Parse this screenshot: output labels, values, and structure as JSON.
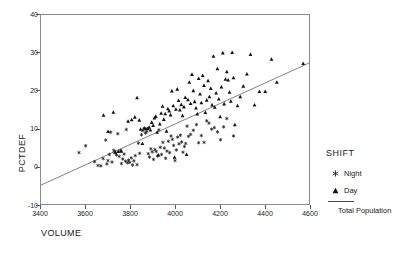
{
  "chart_data": {
    "type": "scatter",
    "title": "",
    "xlabel": "VOLUME",
    "ylabel": "PCTDEF",
    "xlim": [
      3400,
      4600
    ],
    "ylim": [
      -10,
      40
    ],
    "xticks": [
      3400,
      3600,
      3800,
      4000,
      4200,
      4400,
      4600
    ],
    "yticks": [
      -10,
      0,
      10,
      20,
      30,
      40
    ],
    "grid": false,
    "legend_position": "right",
    "legend": {
      "title": "SHIFT",
      "entries": [
        {
          "label": "Night",
          "marker": "asterisk-icon"
        },
        {
          "label": "Day",
          "marker": "triangle-icon"
        },
        {
          "label": "Total Population",
          "marker": "line-icon"
        }
      ]
    },
    "series": [
      {
        "name": "Night",
        "marker": "asterisk",
        "points": [
          [
            3570,
            3.6
          ],
          [
            3600,
            5.4
          ],
          [
            3640,
            1.2
          ],
          [
            3655,
            0.2
          ],
          [
            3668,
            0.1
          ],
          [
            3678,
            2.0
          ],
          [
            3690,
            6.9
          ],
          [
            3695,
            0.6
          ],
          [
            3700,
            1.5
          ],
          [
            3706,
            3.1
          ],
          [
            3712,
            9.0
          ],
          [
            3718,
            1.1
          ],
          [
            3726,
            4.2
          ],
          [
            3732,
            3.5
          ],
          [
            3738,
            3.0
          ],
          [
            3744,
            8.6
          ],
          [
            3750,
            2.6
          ],
          [
            3756,
            4.1
          ],
          [
            3760,
            0.7
          ],
          [
            3766,
            1.9
          ],
          [
            3772,
            3.2
          ],
          [
            3778,
            1.3
          ],
          [
            3782,
            9.7
          ],
          [
            3788,
            0.9
          ],
          [
            3792,
            1.6
          ],
          [
            3798,
            1.0
          ],
          [
            3804,
            2.2
          ],
          [
            3810,
            0.3
          ],
          [
            3816,
            1.4
          ],
          [
            3822,
            2.8
          ],
          [
            3830,
            0.4
          ],
          [
            3836,
            6.1
          ],
          [
            3842,
            3.4
          ],
          [
            3850,
            8.3
          ],
          [
            3856,
            9.4
          ],
          [
            3862,
            9.9
          ],
          [
            3868,
            8.8
          ],
          [
            3874,
            9.2
          ],
          [
            3880,
            3.3
          ],
          [
            3886,
            2.4
          ],
          [
            3892,
            4.6
          ],
          [
            3898,
            3.8
          ],
          [
            3904,
            1.8
          ],
          [
            3910,
            4.4
          ],
          [
            3916,
            3.9
          ],
          [
            3922,
            2.7
          ],
          [
            3928,
            9.6
          ],
          [
            3934,
            5.0
          ],
          [
            3940,
            3.1
          ],
          [
            3946,
            6.3
          ],
          [
            3952,
            4.8
          ],
          [
            3958,
            2.1
          ],
          [
            3964,
            4.0
          ],
          [
            3970,
            6.6
          ],
          [
            3976,
            3.6
          ],
          [
            3982,
            8.0
          ],
          [
            3988,
            7.1
          ],
          [
            3994,
            5.5
          ],
          [
            4000,
            1.5
          ],
          [
            4006,
            4.3
          ],
          [
            4012,
            7.7
          ],
          [
            4018,
            5.9
          ],
          [
            4024,
            8.2
          ],
          [
            4030,
            6.4
          ],
          [
            4036,
            3.7
          ],
          [
            4042,
            5.2
          ],
          [
            4048,
            6.0
          ],
          [
            4054,
            10.6
          ],
          [
            4060,
            7.9
          ],
          [
            4070,
            8.4
          ],
          [
            4082,
            9.5
          ],
          [
            4096,
            11.0
          ],
          [
            4106,
            6.2
          ],
          [
            4118,
            8.1
          ],
          [
            4130,
            6.3
          ],
          [
            4142,
            12.0
          ],
          [
            4152,
            11.4
          ],
          [
            4164,
            9.8
          ],
          [
            4176,
            10.2
          ],
          [
            4190,
            9.1
          ],
          [
            4204,
            7.0
          ],
          [
            4218,
            10.4
          ],
          [
            4232,
            12.6
          ],
          [
            4262,
            8.0
          ]
        ]
      },
      {
        "name": "Day",
        "marker": "triangle",
        "points": [
          [
            3680,
            13.5
          ],
          [
            3700,
            9.2
          ],
          [
            3724,
            14.3
          ],
          [
            3732,
            3.8
          ],
          [
            3746,
            3.9
          ],
          [
            3760,
            4.0
          ],
          [
            3790,
            11.9
          ],
          [
            3806,
            12.3
          ],
          [
            3820,
            13.0
          ],
          [
            3830,
            18.1
          ],
          [
            3840,
            12.2
          ],
          [
            3846,
            9.8
          ],
          [
            3854,
            6.0
          ],
          [
            3862,
            10.1
          ],
          [
            3870,
            9.9
          ],
          [
            3878,
            10.0
          ],
          [
            3884,
            10.3
          ],
          [
            3890,
            9.6
          ],
          [
            3896,
            11.6
          ],
          [
            3902,
            10.8
          ],
          [
            3908,
            12.8
          ],
          [
            3914,
            13.2
          ],
          [
            3920,
            9.0
          ],
          [
            3926,
            3.0
          ],
          [
            3932,
            11.2
          ],
          [
            3938,
            14.0
          ],
          [
            3944,
            15.9
          ],
          [
            3950,
            12.4
          ],
          [
            3956,
            13.9
          ],
          [
            3962,
            9.3
          ],
          [
            3968,
            15.2
          ],
          [
            3974,
            14.6
          ],
          [
            3980,
            13.6
          ],
          [
            3986,
            19.9
          ],
          [
            3992,
            16.0
          ],
          [
            3998,
            2.4
          ],
          [
            4004,
            15.1
          ],
          [
            4010,
            20.4
          ],
          [
            4016,
            17.4
          ],
          [
            4022,
            14.9
          ],
          [
            4028,
            16.3
          ],
          [
            4034,
            13.4
          ],
          [
            4040,
            15.7
          ],
          [
            4046,
            18.2
          ],
          [
            4052,
            3.1
          ],
          [
            4058,
            17.6
          ],
          [
            4064,
            22.2
          ],
          [
            4070,
            16.6
          ],
          [
            4076,
            24.3
          ],
          [
            4082,
            20.0
          ],
          [
            4088,
            17.1
          ],
          [
            4094,
            15.4
          ],
          [
            4100,
            13.8
          ],
          [
            4106,
            23.2
          ],
          [
            4112,
            19.1
          ],
          [
            4118,
            16.8
          ],
          [
            4124,
            24.0
          ],
          [
            4130,
            21.4
          ],
          [
            4136,
            14.2
          ],
          [
            4142,
            17.5
          ],
          [
            4148,
            22.6
          ],
          [
            4154,
            18.4
          ],
          [
            4160,
            20.6
          ],
          [
            4166,
            16.2
          ],
          [
            4172,
            29.1
          ],
          [
            4178,
            15.6
          ],
          [
            4184,
            19.4
          ],
          [
            4190,
            25.8
          ],
          [
            4196,
            17.8
          ],
          [
            4202,
            13.1
          ],
          [
            4208,
            21.0
          ],
          [
            4214,
            30.0
          ],
          [
            4220,
            16.5
          ],
          [
            4226,
            23.0
          ],
          [
            4232,
            25.0
          ],
          [
            4238,
            22.8
          ],
          [
            4244,
            19.6
          ],
          [
            4250,
            17.2
          ],
          [
            4256,
            30.1
          ],
          [
            4262,
            23.4
          ],
          [
            4268,
            11.0
          ],
          [
            4280,
            16.0
          ],
          [
            4292,
            18.4
          ],
          [
            4306,
            21.2
          ],
          [
            4322,
            24.4
          ],
          [
            4338,
            29.6
          ],
          [
            4356,
            16.2
          ],
          [
            4378,
            19.8
          ],
          [
            4404,
            19.8
          ],
          [
            4432,
            28.3
          ],
          [
            4456,
            22.2
          ],
          [
            4574,
            27.2
          ]
        ]
      }
    ],
    "fit_line": {
      "name": "Total Population",
      "x": [
        3400,
        4600
      ],
      "y": [
        -5.0,
        27.3
      ]
    }
  }
}
